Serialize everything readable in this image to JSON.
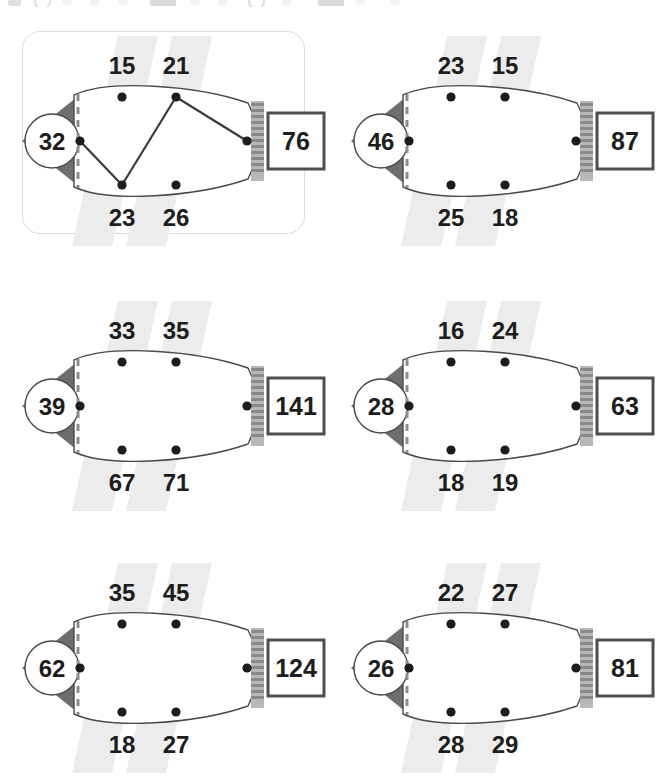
{
  "page": {
    "layout": {
      "columns": 2,
      "rows": 3,
      "width": 658,
      "height": 765
    }
  },
  "colors": {
    "head_dark": "#6e6e6e",
    "head_circle_fill": "#ffffff",
    "body_fill": "#ffffff",
    "body_stroke": "#4a4a4a",
    "node_dot": "#1d1d1d",
    "stripe_band": "#ececec",
    "gill_dash": "#8d8d8d",
    "tail_connector": "#8a8a8a",
    "answer_box_border": "#4e4e4e",
    "card_border": "#dcdcdc",
    "number_text": "#1d1d1d",
    "path_line": "#3a3a3a"
  },
  "toolbar_strip": {
    "visible": true,
    "note": "cut-off icon row at top edge",
    "icons": [
      "square-icon",
      "circle-icon",
      "dot-icon",
      "dot-icon",
      "dot-icon",
      "rectangle-icon",
      "dot-icon",
      "dot-icon",
      "circle-icon",
      "dot-icon",
      "rectangle-icon",
      "dot-icon",
      "dot-icon"
    ]
  },
  "puzzles": [
    {
      "id": "puzzle-1",
      "position": "top-left",
      "highlighted": true,
      "solved": true,
      "head_value": "32",
      "top_labels": [
        "15",
        "21"
      ],
      "bottom_labels": [
        "23",
        "26"
      ],
      "answer": "76",
      "solution_path": [
        "head",
        "bottom-left",
        "top-right",
        "tail"
      ],
      "solution_values": [
        "32",
        "23",
        "21",
        "76"
      ]
    },
    {
      "id": "puzzle-2",
      "position": "top-right",
      "highlighted": false,
      "solved": false,
      "head_value": "46",
      "top_labels": [
        "23",
        "15"
      ],
      "bottom_labels": [
        "25",
        "18"
      ],
      "answer": "87",
      "solution_path": [],
      "solution_values": []
    },
    {
      "id": "puzzle-3",
      "position": "middle-left",
      "highlighted": false,
      "solved": false,
      "head_value": "39",
      "top_labels": [
        "33",
        "35"
      ],
      "bottom_labels": [
        "67",
        "71"
      ],
      "answer": "141",
      "solution_path": [],
      "solution_values": []
    },
    {
      "id": "puzzle-4",
      "position": "middle-right",
      "highlighted": false,
      "solved": false,
      "head_value": "28",
      "top_labels": [
        "16",
        "24"
      ],
      "bottom_labels": [
        "18",
        "19"
      ],
      "answer": "63",
      "solution_path": [],
      "solution_values": []
    },
    {
      "id": "puzzle-5",
      "position": "bottom-left",
      "highlighted": false,
      "solved": false,
      "head_value": "62",
      "top_labels": [
        "35",
        "45"
      ],
      "bottom_labels": [
        "18",
        "27"
      ],
      "answer": "124",
      "solution_path": [],
      "solution_values": []
    },
    {
      "id": "puzzle-6",
      "position": "bottom-right",
      "highlighted": false,
      "solved": false,
      "head_value": "26",
      "top_labels": [
        "22",
        "27"
      ],
      "bottom_labels": [
        "28",
        "29"
      ],
      "answer": "81",
      "solution_path": [],
      "solution_values": []
    }
  ]
}
